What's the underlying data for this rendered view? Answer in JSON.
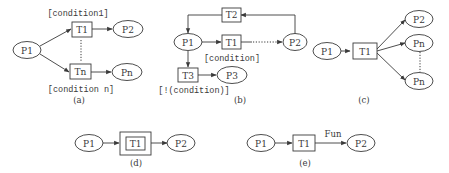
{
  "colors": {
    "stroke": "#3a3a3a",
    "background": "#ffffff"
  },
  "panels": {
    "a": {
      "caption": "(a)",
      "places": {
        "p1": "P1",
        "p2": "P2",
        "pn": "Pn"
      },
      "transitions": {
        "t1": "T1",
        "tn": "Tn"
      },
      "conditions": {
        "top": "[condition1]",
        "bottom": "[condition n]"
      }
    },
    "b": {
      "caption": "(b)",
      "places": {
        "p1": "P1",
        "p2": "P2",
        "p3": "P3"
      },
      "transitions": {
        "t1": "T1",
        "t2": "T2",
        "t3": "T3"
      },
      "conditions": {
        "t1": "[condition]",
        "t3": "[!(condition)]"
      }
    },
    "c": {
      "caption": "(c)",
      "places": {
        "p1": "P1",
        "p2": "P2",
        "pn1": "Pn",
        "pn2": "Pn"
      },
      "transitions": {
        "t1": "T1"
      }
    },
    "d": {
      "caption": "(d)",
      "places": {
        "p1": "P1",
        "p2": "P2"
      },
      "transitions": {
        "t1": "T1"
      }
    },
    "e": {
      "caption": "(e)",
      "places": {
        "p1": "P1",
        "p2": "P2"
      },
      "transitions": {
        "t1": "T1"
      },
      "edge_label": "Fun"
    }
  }
}
